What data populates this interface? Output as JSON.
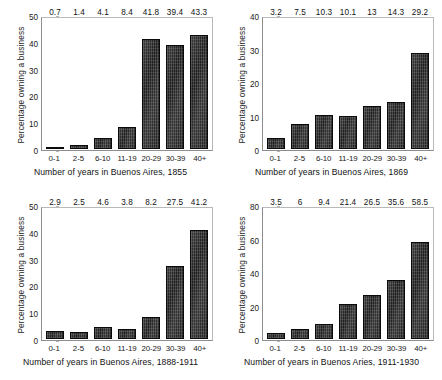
{
  "figure": {
    "background": "#ffffff",
    "bar_color": "#2a2a2a",
    "frame_color": "#8d8d8d",
    "text_color": "#111111",
    "layout": "2x2 grid of bar charts"
  },
  "chart_data": [
    {
      "type": "bar",
      "title": "",
      "xlabel": "Number of years in Buenos Aires, 1855",
      "ylabel": "Percentage owning a  business",
      "categories": [
        "0-1",
        "2-5",
        "6-10",
        "11-19",
        "20-29",
        "30-39",
        "40+"
      ],
      "values": [
        0.7,
        1.4,
        4.1,
        8.4,
        41.8,
        39.4,
        43.3
      ],
      "value_labels": [
        "0.7",
        "1.4",
        "4.1",
        "8.4",
        "41.8",
        "39.4",
        "43.3"
      ],
      "ylim": [
        0,
        50
      ],
      "yticks": [
        0,
        10,
        20,
        30,
        40,
        50
      ],
      "ytick_labels": [
        "0",
        "10",
        "20",
        "30",
        "40",
        "50"
      ],
      "grid": false,
      "legend": "none"
    },
    {
      "type": "bar",
      "title": "",
      "xlabel": "Number of years in Buenos Aires, 1869",
      "ylabel": "Percentage owning a business",
      "categories": [
        "0-1",
        "2-5",
        "6-10",
        "11-19",
        "20-29",
        "30-39",
        "40+"
      ],
      "values": [
        3.2,
        7.5,
        10.3,
        10.1,
        13,
        14.3,
        29.2
      ],
      "value_labels": [
        "3.2",
        "7.5",
        "10.3",
        "10.1",
        "13",
        "14.3",
        "29.2"
      ],
      "ylim": [
        0,
        40
      ],
      "yticks": [
        0,
        10,
        20,
        30,
        40
      ],
      "ytick_labels": [
        "0",
        "10",
        "20",
        "30",
        "40"
      ],
      "grid": false,
      "legend": "none"
    },
    {
      "type": "bar",
      "title": "",
      "xlabel": "Number of years in Buenos Aires, 1888-1911",
      "ylabel": "Percentage owning a business",
      "categories": [
        "0-1",
        "2-5",
        "6-10",
        "11-19",
        "20-29",
        "30-39",
        "40+"
      ],
      "values": [
        2.9,
        2.5,
        4.6,
        3.8,
        8.2,
        27.5,
        41.2
      ],
      "value_labels": [
        "2.9",
        "2.5",
        "4.6",
        "3.8",
        "8.2",
        "27.5",
        "41.2"
      ],
      "ylim": [
        0,
        50
      ],
      "yticks": [
        0,
        10,
        20,
        30,
        40,
        50
      ],
      "ytick_labels": [
        "0",
        "10",
        "20",
        "30",
        "40",
        "50"
      ],
      "grid": false,
      "legend": "none"
    },
    {
      "type": "bar",
      "title": "",
      "xlabel": "Number of years in Buenos Aries, 1911-1930",
      "ylabel": "Percentage owning  a business",
      "categories": [
        "0-1",
        "2-5",
        "6-10",
        "11-19",
        "20-29",
        "30-39",
        "40+"
      ],
      "values": [
        3.5,
        6,
        9.4,
        21.4,
        26.5,
        35.6,
        58.5
      ],
      "value_labels": [
        "3.5",
        "6",
        "9.4",
        "21.4",
        "26.5",
        "35.6",
        "58.5"
      ],
      "ylim": [
        0,
        80
      ],
      "yticks": [
        0,
        20,
        40,
        60,
        80
      ],
      "ytick_labels": [
        "0",
        "20",
        "40",
        "60",
        "80"
      ],
      "grid": false,
      "legend": "none"
    }
  ]
}
